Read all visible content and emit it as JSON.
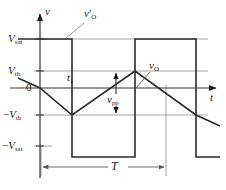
{
  "figure": {
    "kind": "waveform-timing-diagram",
    "title": "",
    "background": "#ffffff",
    "width": 226,
    "height": 190
  },
  "axes": {
    "vertical_label": "v",
    "horizontal_label": "t",
    "origin_label": "0",
    "axis_color": "#333333",
    "origin_x": 40,
    "origin_y": 88
  },
  "levels": [
    {
      "id": "v-sat-pos",
      "label": "V",
      "sub": "sat",
      "sign": "",
      "y": 39,
      "value_name": "+Vsat"
    },
    {
      "id": "v-th-pos",
      "label": "V",
      "sub": "th",
      "sign": "",
      "y": 71,
      "value_name": "+Vth"
    },
    {
      "id": "zero",
      "label": "0",
      "sub": "",
      "sign": "",
      "y": 88,
      "value_name": "0"
    },
    {
      "id": "v-th-neg",
      "label": "V",
      "sub": "th",
      "sign": "−",
      "y": 115,
      "value_name": "-Vth"
    },
    {
      "id": "v-sat-neg",
      "label": "V",
      "sub": "sat",
      "sign": "−",
      "y": 146,
      "value_name": "-Vsat"
    }
  ],
  "gridlines": {
    "color": "#9a9a9a",
    "rows": [
      39,
      71,
      115,
      146
    ]
  },
  "waveforms": [
    {
      "id": "square-wave",
      "name": "v'O",
      "label_text": "v",
      "label_sub": "O",
      "label_prime": "′",
      "label_x": 86,
      "label_y": 14,
      "color": "#2b2b2b",
      "stroke_width": 1.6,
      "description": "comparator output square wave alternating between +Vsat and -Vsat",
      "points": [
        [
          18,
          39
        ],
        [
          72,
          39
        ],
        [
          72,
          157
        ],
        [
          135,
          157
        ],
        [
          135,
          39
        ],
        [
          196,
          39
        ],
        [
          196,
          157
        ],
        [
          220,
          157
        ]
      ]
    },
    {
      "id": "triangle-wave",
      "name": "vO",
      "label_text": "v",
      "label_sub": "O",
      "label_prime": "",
      "label_x": 150,
      "label_y": 66,
      "color": "#2b2b2b",
      "stroke_width": 1.6,
      "description": "integrator output triangular wave swinging between +Vth and -Vth",
      "points": [
        [
          18,
          78
        ],
        [
          40,
          88
        ],
        [
          72,
          115
        ],
        [
          135,
          71
        ],
        [
          196,
          115
        ],
        [
          220,
          126
        ]
      ]
    }
  ],
  "annotations": [
    {
      "id": "t1-label",
      "text": "t",
      "sub": "1",
      "x": 72,
      "y": 76,
      "style": "italic",
      "description": "time marker t1 inside first half period"
    },
    {
      "id": "vpp-label",
      "text": "v",
      "sub": "pp",
      "x": 112,
      "y": 98,
      "style": "italic",
      "description": "peak to peak amplitude of triangular wave"
    },
    {
      "id": "period-label",
      "text": "T",
      "sub": "",
      "x": 117,
      "y": 161,
      "style": "italic",
      "description": "full period of the oscillation"
    }
  ],
  "measure_arrows": [
    {
      "id": "vpp-arrow",
      "orientation": "vertical",
      "x": 116,
      "y1": 71,
      "y2": 115,
      "double_headed": true,
      "color": "#1a1a1a",
      "label_ref": "vpp-label"
    },
    {
      "id": "period-arrow",
      "orientation": "horizontal",
      "y": 167,
      "x1": 41,
      "x2": 166,
      "double_headed": true,
      "color": "#7d7d7d",
      "label_ref": "period-label"
    }
  ],
  "leader_lines": [
    {
      "id": "vprime-o-leader",
      "from": [
        84,
        22
      ],
      "to": [
        66,
        38
      ],
      "color": "#8a8a8a"
    },
    {
      "id": "vo-leader",
      "from": [
        150,
        72
      ],
      "to": [
        137,
        89
      ],
      "color": "#555555"
    }
  ],
  "drop_lines": {
    "color": "#9a9a9a",
    "lines": [
      {
        "id": "drop-line-period-start",
        "x": 41,
        "y1": 146,
        "y2": 174
      },
      {
        "id": "drop-line-period-end",
        "x": 166,
        "y1": 85,
        "y2": 174
      }
    ]
  }
}
